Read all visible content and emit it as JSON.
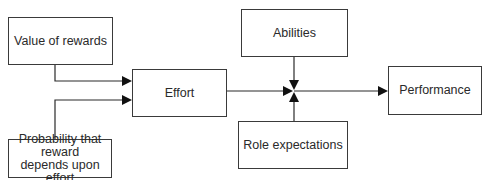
{
  "diagram": {
    "title": "",
    "nodes": {
      "value_of_rewards": {
        "label": "Value of rewards"
      },
      "probability": {
        "label": "Probability that reward depends upon effort"
      },
      "effort": {
        "label": "Effort"
      },
      "abilities": {
        "label": "Abilities"
      },
      "role_expectations": {
        "label": "Role expectations"
      },
      "performance": {
        "label": "Performance"
      }
    },
    "edges": [
      {
        "from": "Value of rewards",
        "to": "Effort"
      },
      {
        "from": "Probability that reward depends upon effort",
        "to": "Effort"
      },
      {
        "from": "Effort",
        "to": "Junction"
      },
      {
        "from": "Abilities",
        "to": "Junction"
      },
      {
        "from": "Role expectations",
        "to": "Junction"
      },
      {
        "from": "Junction",
        "to": "Performance"
      }
    ],
    "colors": {
      "line": "#2a2a2a",
      "border": "#3a3a3a",
      "text": "#2a2a2a",
      "background": "#ffffff"
    }
  }
}
